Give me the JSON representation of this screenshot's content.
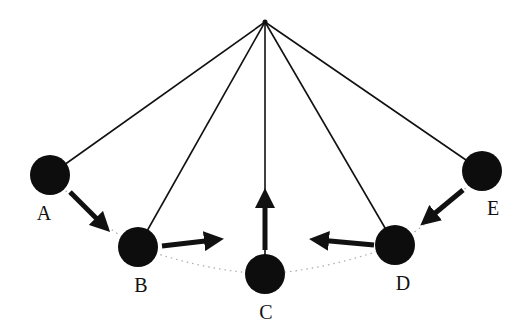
{
  "diagram": {
    "type": "pendulum-motion",
    "pivot": {
      "x": 265,
      "y": 22
    },
    "colors": {
      "line": "#111111",
      "ball": "#0d0d0d",
      "arc": "#aaaaaa",
      "background": "#ffffff"
    },
    "positions": [
      {
        "id": "A",
        "label": "A",
        "x": 50,
        "y": 175,
        "lx": 44,
        "ly": 213,
        "arrow": {
          "x1": 70,
          "y1": 192,
          "x2": 103,
          "y2": 225
        }
      },
      {
        "id": "B",
        "label": "B",
        "x": 138,
        "y": 247,
        "lx": 141,
        "ly": 285,
        "arrow": {
          "x1": 162,
          "y1": 246,
          "x2": 214,
          "y2": 240
        }
      },
      {
        "id": "C",
        "label": "C",
        "x": 265,
        "y": 274,
        "lx": 266,
        "ly": 312,
        "arrow": {
          "x1": 265,
          "y1": 250,
          "x2": 265,
          "y2": 198
        }
      },
      {
        "id": "D",
        "label": "D",
        "x": 395,
        "y": 245,
        "lx": 403,
        "ly": 283,
        "arrow": {
          "x1": 374,
          "y1": 245,
          "x2": 319,
          "y2": 240
        }
      },
      {
        "id": "E",
        "label": "E",
        "x": 482,
        "y": 171,
        "lx": 493,
        "ly": 208,
        "arrow": {
          "x1": 463,
          "y1": 190,
          "x2": 428,
          "y2": 219
        }
      }
    ]
  }
}
